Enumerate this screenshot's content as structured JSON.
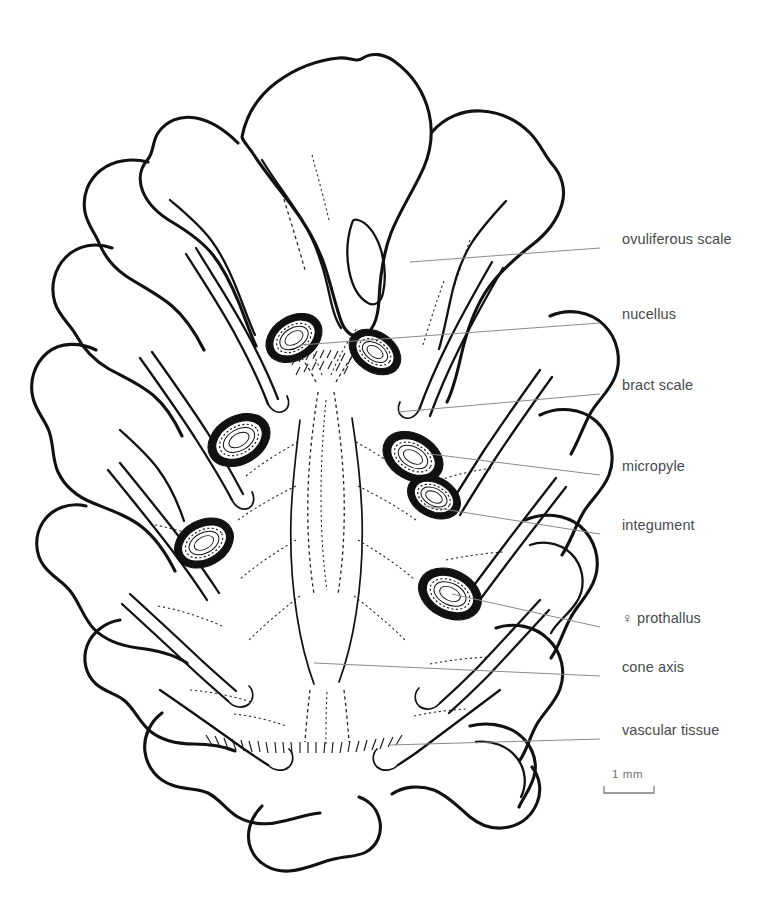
{
  "figure": {
    "kind": "botanical-line-drawing",
    "background_color": "#ffffff",
    "ink_color": "#111111",
    "leader_color": "#8a8a8a",
    "label_color": "#4a4a4a"
  },
  "labels": [
    {
      "id": "ovuliferous-scale",
      "text": "ovuliferous scale",
      "x": 622,
      "y": 241,
      "leader": {
        "x1": 600,
        "y1": 248,
        "x2": 410,
        "y2": 262
      }
    },
    {
      "id": "nucellus",
      "text": "nucellus",
      "x": 622,
      "y": 316,
      "leader": {
        "x1": 600,
        "y1": 323,
        "x2": 300,
        "y2": 345
      }
    },
    {
      "id": "bract-scale",
      "text": "bract scale",
      "x": 622,
      "y": 387,
      "leader": {
        "x1": 600,
        "y1": 394,
        "x2": 398,
        "y2": 412
      }
    },
    {
      "id": "micropyle",
      "text": "micropyle",
      "x": 622,
      "y": 468,
      "leader": {
        "x1": 600,
        "y1": 475,
        "x2": 430,
        "y2": 454
      }
    },
    {
      "id": "integument",
      "text": "integument",
      "x": 622,
      "y": 527,
      "leader": {
        "x1": 600,
        "y1": 534,
        "x2": 424,
        "y2": 506
      }
    },
    {
      "id": "prothallus",
      "text": "♀ prothallus",
      "x": 622,
      "y": 620,
      "leader": {
        "x1": 600,
        "y1": 627,
        "x2": 452,
        "y2": 594
      }
    },
    {
      "id": "cone-axis",
      "text": "cone axis",
      "x": 622,
      "y": 669,
      "leader": {
        "x1": 600,
        "y1": 676,
        "x2": 314,
        "y2": 663
      }
    },
    {
      "id": "vascular-tissue",
      "text": "vascular tissue",
      "x": 622,
      "y": 732,
      "leader": {
        "x1": 600,
        "y1": 739,
        "x2": 390,
        "y2": 745
      }
    }
  ],
  "scale_bar": {
    "caption": "1 mm",
    "caption_x": 612,
    "caption_y": 775,
    "x1": 604,
    "x2": 654,
    "y": 793,
    "tick_height": 7
  }
}
